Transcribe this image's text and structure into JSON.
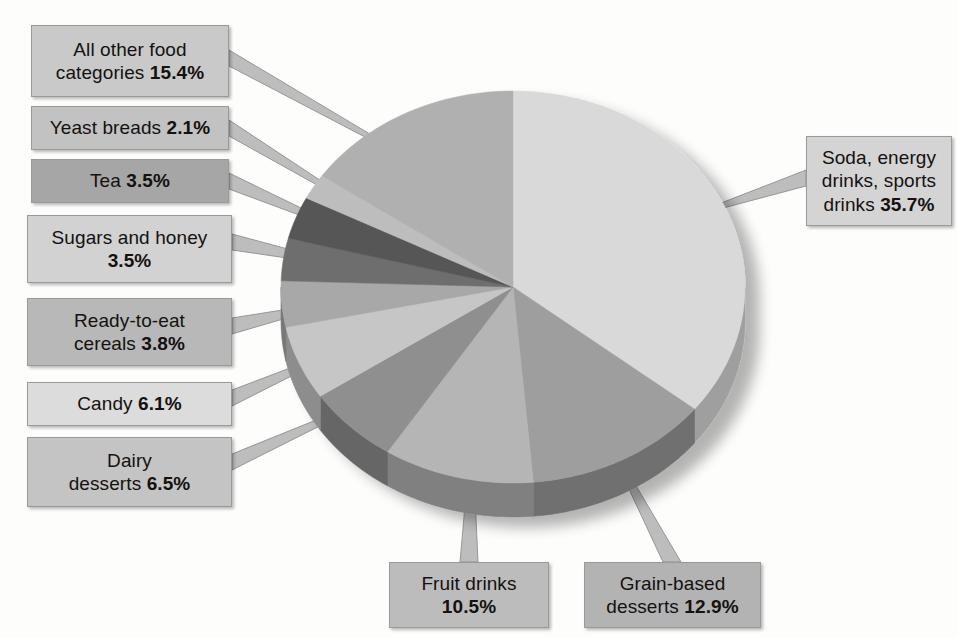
{
  "chart_data": {
    "type": "pie",
    "title": "",
    "subtitle": "",
    "xlabel": "",
    "ylabel": "",
    "legend_position": "callouts",
    "grid": false,
    "units": "percent",
    "start_angle_deg": 0,
    "direction": "clockwise",
    "categories": [
      "Soda, energy drinks, sports drinks",
      "Grain-based desserts",
      "Fruit drinks",
      "Dairy desserts",
      "Candy",
      "Ready-to-eat cereals",
      "Sugars and honey",
      "Tea",
      "Yeast breads",
      "All other food categories"
    ],
    "values": [
      35.7,
      12.9,
      10.5,
      6.5,
      6.1,
      3.8,
      3.5,
      3.5,
      2.1,
      15.4
    ],
    "slice_colors": [
      "#d9d9d9",
      "#9e9e9e",
      "#b5b5b5",
      "#8f8f8f",
      "#c6c6c6",
      "#a8a8a8",
      "#6e6e6e",
      "#565656",
      "#bdbdbd",
      "#b0b0b0"
    ],
    "side_colors": [
      "#9f9f9f",
      "#6f6f6f",
      "#808080",
      "#666666",
      "#8d8d8d",
      "#787878",
      "#4e4e4e",
      "#3c3c3c",
      "#868686",
      "#7c7c7c"
    ]
  },
  "callouts": [
    {
      "id": "all-other-food-categories",
      "label": "All other food",
      "label2": "categories",
      "percent": "15.4%",
      "box_color": "#c9c9c9"
    },
    {
      "id": "yeast-breads",
      "label": "Yeast breads",
      "label2": "",
      "percent": "2.1%",
      "box_color": "#c2c2c2"
    },
    {
      "id": "tea",
      "label": "Tea",
      "label2": "",
      "percent": "3.5%",
      "box_color": "#a6a6a6"
    },
    {
      "id": "sugars-and-honey",
      "label": "Sugars and honey",
      "label2": "",
      "percent": "3.5%",
      "box_color": "#d2d2d2"
    },
    {
      "id": "ready-to-eat-cereals",
      "label": "Ready-to-eat",
      "label2": "cereals",
      "percent": "3.8%",
      "box_color": "#b8b8b8"
    },
    {
      "id": "candy",
      "label": "Candy",
      "label2": "",
      "percent": "6.1%",
      "box_color": "#dcdcdc"
    },
    {
      "id": "dairy-desserts",
      "label": "Dairy",
      "label2": "desserts",
      "percent": "6.5%",
      "box_color": "#c4c4c4"
    },
    {
      "id": "fruit-drinks",
      "label": "Fruit drinks",
      "label2": "",
      "percent": "10.5%",
      "box_color": "#bcbcbc"
    },
    {
      "id": "grain-based-desserts",
      "label": "Grain-based",
      "label2": "desserts",
      "percent": "12.9%",
      "box_color": "#b3b3b3"
    },
    {
      "id": "soda-energy-sports-drinks",
      "label": "Soda, energy",
      "label2": "drinks, sports",
      "label3": "drinks",
      "percent": "35.7%",
      "box_color": "#d4d4d4"
    }
  ],
  "colors": {
    "background": "#fdfdfc",
    "box_border": "#9a9a9a",
    "leader_line": "#bdbdbd",
    "leader_line_stroke": "#8e8e8e",
    "text": "#14110f"
  }
}
